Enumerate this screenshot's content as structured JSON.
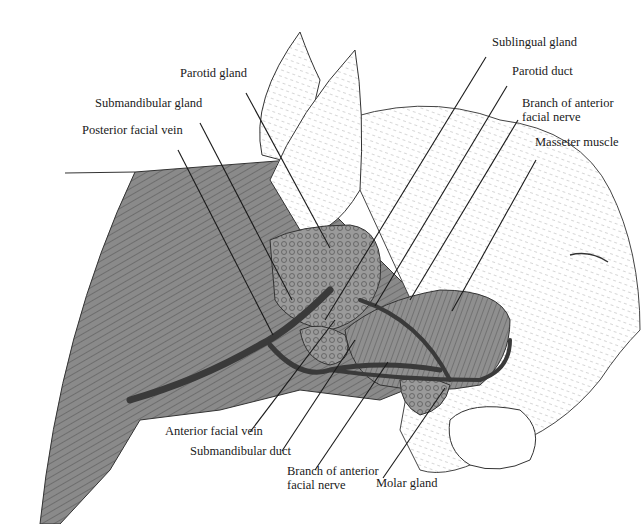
{
  "figure": {
    "labels": [
      {
        "id": "parotid-gland",
        "text": "Parotid gland",
        "x": 180,
        "y": 77
      },
      {
        "id": "submandibular-gland",
        "text": "Submandibular gland",
        "x": 95,
        "y": 107
      },
      {
        "id": "posterior-facial-vein",
        "text": "Posterior facial vein",
        "x": 82,
        "y": 134
      },
      {
        "id": "sublingual-gland",
        "text": "Sublingual gland",
        "x": 492,
        "y": 46
      },
      {
        "id": "parotid-duct",
        "text": "Parotid duct",
        "x": 512,
        "y": 75
      },
      {
        "id": "branch-anterior-facial-nerve-top-1",
        "text": "Branch of anterior",
        "x": 522,
        "y": 107
      },
      {
        "id": "branch-anterior-facial-nerve-top-2",
        "text": "facial nerve",
        "x": 522,
        "y": 121
      },
      {
        "id": "masseter-muscle",
        "text": "Masseter muscle",
        "x": 535,
        "y": 146
      },
      {
        "id": "anterior-facial-vein",
        "text": "Anterior facial vein",
        "x": 165,
        "y": 435
      },
      {
        "id": "submandibular-duct",
        "text": "Submandibular duct",
        "x": 190,
        "y": 455
      },
      {
        "id": "branch-anterior-facial-nerve-bottom-1",
        "text": "Branch of anterior",
        "x": 287,
        "y": 475
      },
      {
        "id": "branch-anterior-facial-nerve-bottom-2",
        "text": "facial nerve",
        "x": 287,
        "y": 489
      },
      {
        "id": "molar-gland",
        "text": "Molar gland",
        "x": 376,
        "y": 487
      }
    ],
    "leader_lines": [
      {
        "for": "parotid-gland",
        "x1": 246,
        "y1": 93,
        "x2": 330,
        "y2": 248
      },
      {
        "for": "submandibular-gland",
        "x1": 200,
        "y1": 123,
        "x2": 292,
        "y2": 300
      },
      {
        "for": "posterior-facial-vein",
        "x1": 178,
        "y1": 150,
        "x2": 273,
        "y2": 335
      },
      {
        "for": "sublingual-gland",
        "x1": 486,
        "y1": 57,
        "x2": 325,
        "y2": 320
      },
      {
        "for": "parotid-duct",
        "x1": 507,
        "y1": 86,
        "x2": 375,
        "y2": 306
      },
      {
        "for": "branch-anterior-facial-nerve-top",
        "x1": 518,
        "y1": 120,
        "x2": 410,
        "y2": 300
      },
      {
        "for": "masseter-muscle",
        "x1": 536,
        "y1": 160,
        "x2": 452,
        "y2": 311
      },
      {
        "for": "anterior-facial-vein",
        "x1": 250,
        "y1": 432,
        "x2": 335,
        "y2": 320
      },
      {
        "for": "submandibular-duct",
        "x1": 282,
        "y1": 451,
        "x2": 355,
        "y2": 340
      },
      {
        "for": "branch-anterior-facial-nerve-bottom",
        "x1": 315,
        "y1": 470,
        "x2": 388,
        "y2": 362
      },
      {
        "for": "molar-gland",
        "x1": 383,
        "y1": 478,
        "x2": 445,
        "y2": 388
      }
    ]
  }
}
